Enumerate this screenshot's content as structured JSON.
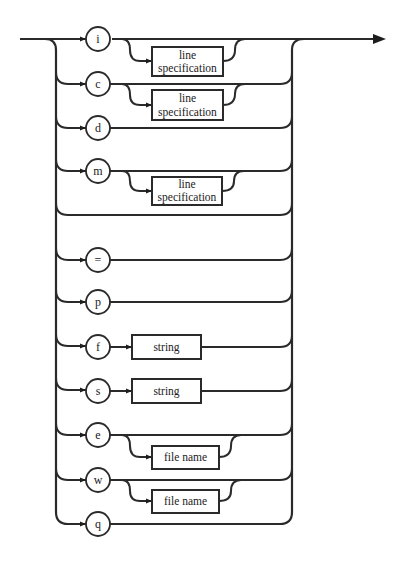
{
  "diagram": {
    "type": "syntax-railroad",
    "branches": [
      {
        "key": "i",
        "option": "line specification",
        "option_lines": [
          "line",
          "specification"
        ],
        "optional": true
      },
      {
        "key": "c",
        "option": "line specification",
        "option_lines": [
          "line",
          "specification"
        ],
        "optional": true
      },
      {
        "key": "d"
      },
      {
        "key": "m",
        "option": "line specification",
        "option_lines": [
          "line",
          "specification"
        ],
        "optional": true
      },
      {
        "key": "(empty)"
      },
      {
        "key": "="
      },
      {
        "key": "p"
      },
      {
        "key": "f",
        "option": "string",
        "optional": false
      },
      {
        "key": "s",
        "option": "string",
        "optional": false
      },
      {
        "key": "e",
        "option": "file name",
        "optional": true
      },
      {
        "key": "w",
        "option": "file name",
        "optional": true
      },
      {
        "key": "q"
      }
    ]
  },
  "labels": {
    "i": "i",
    "c": "c",
    "d": "d",
    "m": "m",
    "eq": "=",
    "p": "p",
    "f": "f",
    "s": "s",
    "e": "e",
    "w": "w",
    "q": "q",
    "line": "line",
    "specification": "specification",
    "string": "string",
    "file_name": "file name"
  }
}
